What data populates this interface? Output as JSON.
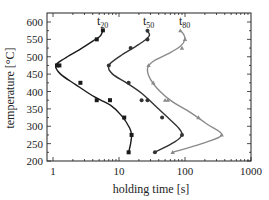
{
  "chart_data": {
    "type": "line",
    "title": "",
    "xlabel": "holding time [s]",
    "ylabel": "temperature [°C]",
    "xscale": "log",
    "xlim": [
      1,
      1000
    ],
    "ylim": [
      200,
      620
    ],
    "xticks": [
      1,
      10,
      100,
      1000
    ],
    "xtick_labels": [
      "1",
      "10",
      "100",
      "1000"
    ],
    "yticks": [
      200,
      250,
      300,
      350,
      400,
      450,
      500,
      550,
      600
    ],
    "ytick_labels": [
      "200",
      "250",
      "300",
      "350",
      "400",
      "450",
      "500",
      "550",
      "600"
    ],
    "grid": false,
    "legend": "inline curve labels at top",
    "series": [
      {
        "name": "t20",
        "label_main": "t",
        "label_sub": "20",
        "color": "#1a1a1a",
        "marker": "square",
        "points": [
          [
            5.7,
            576
          ],
          [
            4.6,
            550
          ],
          [
            1.15,
            475
          ],
          [
            1.25,
            475
          ],
          [
            2.6,
            425
          ],
          [
            4.6,
            375
          ],
          [
            7.3,
            375
          ],
          [
            12,
            325
          ],
          [
            15.5,
            275
          ],
          [
            14,
            225
          ]
        ],
        "curve": [
          [
            5.7,
            576
          ],
          [
            5.2,
            560
          ],
          [
            4.0,
            545
          ],
          [
            2.5,
            520
          ],
          [
            1.5,
            495
          ],
          [
            1.1,
            475
          ],
          [
            1.3,
            450
          ],
          [
            2.2,
            420
          ],
          [
            4.2,
            385
          ],
          [
            7.5,
            360
          ],
          [
            11,
            330
          ],
          [
            14.5,
            295
          ],
          [
            15.5,
            275
          ],
          [
            15,
            250
          ],
          [
            14,
            225
          ]
        ]
      },
      {
        "name": "t50",
        "label_main": "t",
        "label_sub": "50",
        "color": "#333333",
        "marker": "circle",
        "points": [
          [
            27,
            575
          ],
          [
            27,
            550
          ],
          [
            15,
            525
          ],
          [
            7,
            475
          ],
          [
            14,
            425
          ],
          [
            22,
            375
          ],
          [
            27,
            375
          ],
          [
            45,
            325
          ],
          [
            90,
            275
          ],
          [
            35,
            225
          ]
        ],
        "curve": [
          [
            27,
            575
          ],
          [
            29,
            562
          ],
          [
            25,
            548
          ],
          [
            18,
            530
          ],
          [
            11,
            505
          ],
          [
            7,
            475
          ],
          [
            8,
            450
          ],
          [
            13,
            425
          ],
          [
            22,
            395
          ],
          [
            35,
            360
          ],
          [
            55,
            325
          ],
          [
            80,
            295
          ],
          [
            90,
            275
          ],
          [
            70,
            255
          ],
          [
            35,
            225
          ]
        ]
      },
      {
        "name": "t80",
        "label_main": "t",
        "label_sub": "80",
        "color": "#8a8a8a",
        "marker": "triangle",
        "points": [
          [
            85,
            575
          ],
          [
            100,
            550
          ],
          [
            90,
            525
          ],
          [
            28,
            475
          ],
          [
            33,
            425
          ],
          [
            50,
            375
          ],
          [
            55,
            375
          ],
          [
            160,
            325
          ],
          [
            360,
            275
          ],
          [
            65,
            225
          ]
        ],
        "curve": [
          [
            85,
            575
          ],
          [
            95,
            565
          ],
          [
            100,
            550
          ],
          [
            85,
            530
          ],
          [
            55,
            508
          ],
          [
            32,
            485
          ],
          [
            27,
            465
          ],
          [
            30,
            435
          ],
          [
            42,
            400
          ],
          [
            65,
            370
          ],
          [
            120,
            340
          ],
          [
            220,
            305
          ],
          [
            360,
            275
          ],
          [
            180,
            250
          ],
          [
            65,
            225
          ]
        ]
      }
    ]
  },
  "axes": {
    "xlabel": "holding time [s]",
    "ylabel": "temperature [°C]"
  },
  "labels": {
    "t20_main": "t",
    "t20_sub": "20",
    "t50_main": "t",
    "t50_sub": "50",
    "t80_main": "t",
    "t80_sub": "80"
  }
}
